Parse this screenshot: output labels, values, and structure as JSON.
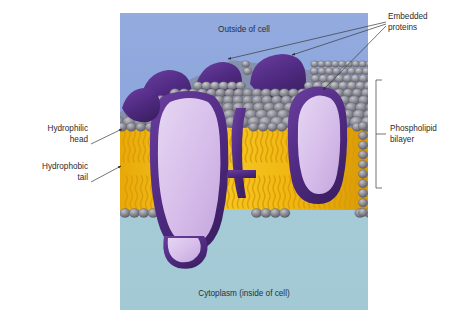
{
  "figure": {
    "panel": {
      "outside_bg_color": "#8fa8dd",
      "cytoplasm_bg_color": "#a8cdd8"
    },
    "colors": {
      "head_gray": "#8d8d96",
      "head_gray_dark": "#6e6e78",
      "head_highlight": "#b9b9c1",
      "tail_yellow": "#f5c217",
      "tail_yellow_dark": "#d79b08",
      "protein_light": "#d9c3ea",
      "protein_dark": "#4e2a7e",
      "protein_mid": "#6b3fa0",
      "leader_line": "#3a3a3a",
      "text": "#2b2b2b"
    },
    "in_panel_labels": [
      {
        "id": "outside-of-cell",
        "text": "Outside of cell"
      },
      {
        "id": "cytoplasm",
        "text": "Cytoplasm (inside of cell)"
      }
    ],
    "callouts": [
      {
        "id": "embedded-proteins",
        "text_line_1": "Embedded",
        "text_line_2": "proteins",
        "arrow_count": 3,
        "side": "right-top"
      },
      {
        "id": "phospholipid-bilayer",
        "text_line_1": "Phospholipid",
        "text_line_2": "bilayer",
        "marker": "bracket",
        "side": "right-middle"
      },
      {
        "id": "hydrophilic-head",
        "text_line_1": "Hydrophilic",
        "text_line_2": "head",
        "arrow_count": 1,
        "side": "left-upper"
      },
      {
        "id": "hydrophobic-tail",
        "text_line_1": "Hydrophobic",
        "text_line_2": "tail",
        "arrow_count": 1,
        "side": "left-lower"
      }
    ]
  }
}
